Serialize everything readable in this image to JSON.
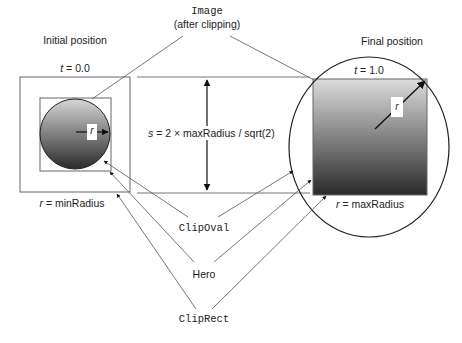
{
  "labels": {
    "initial_position": "Initial position",
    "final_position": "Final position",
    "image_title": "Image",
    "image_subtitle": "(after clipping)",
    "t_initial_var": "t",
    "t_initial_value": " = 0.0",
    "t_final_var": "t",
    "t_final_value": " = 1.0",
    "r_min_var": "r",
    "r_min_value": " = minRadius",
    "r_max_var": "r",
    "r_max_value": " = maxRadius",
    "s_formula_var": "s",
    "s_formula_value": " = 2 × maxRadius / sqrt(2)",
    "radius_tag_left": "r",
    "radius_tag_right": "r",
    "clip_oval": "ClipOval",
    "hero": "Hero",
    "clip_rect": "ClipRect"
  },
  "colors": {
    "line": "#555555",
    "outline": "#222222",
    "gradient_light": "#d8d8d8",
    "gradient_dark": "#2a2a2a"
  }
}
